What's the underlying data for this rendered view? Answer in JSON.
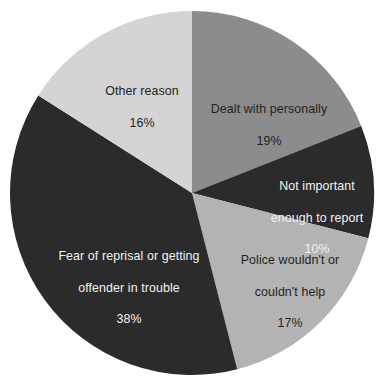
{
  "chart_data": {
    "type": "pie",
    "title": "",
    "subtitle": "",
    "xlabel": "",
    "ylabel": "",
    "legend_position": "none",
    "labels_inside_slices": true,
    "start_angle_deg": 0,
    "direction": "clockwise",
    "units": "percent",
    "categories": [
      "Dealt with personally",
      "Not important enough to report",
      "Police wouldn't or couldn't help",
      "Fear of reprisal or getting offender in trouble",
      "Other reason"
    ],
    "values": [
      19,
      10,
      17,
      38,
      16
    ],
    "slices": [
      {
        "id": "dealt-with-personally",
        "label": "Dealt with personally",
        "label_line1": "Dealt with personally",
        "label_line2": "",
        "value": 19,
        "value_text": "19%",
        "color": "#8c8c8c",
        "text_color": "#231f20",
        "start_deg": 0,
        "end_deg": 68.4
      },
      {
        "id": "not-important-enough-to-report",
        "label": "Not important enough to report",
        "label_line1": "Not important",
        "label_line2": "enough to report",
        "value": 10,
        "value_text": "10%",
        "color": "#2b2b2b",
        "text_color": "#f2f2f2",
        "start_deg": 68.4,
        "end_deg": 104.4
      },
      {
        "id": "police-wouldnt-or-couldnt-help",
        "label": "Police wouldn't or couldn't help",
        "label_line1": "Police wouldn't or",
        "label_line2": "couldn't help",
        "value": 17,
        "value_text": "17%",
        "color": "#b3b3b3",
        "text_color": "#231f20",
        "start_deg": 104.4,
        "end_deg": 165.6
      },
      {
        "id": "fear-of-reprisal-or-getting-offender-in-trouble",
        "label": "Fear of reprisal or getting offender in trouble",
        "label_line1": "Fear of reprisal or getting",
        "label_line2": "offender in trouble",
        "value": 38,
        "value_text": "38%",
        "color": "#2b2b2b",
        "text_color": "#f2f2f2",
        "start_deg": 165.6,
        "end_deg": 302.4
      },
      {
        "id": "other-reason",
        "label": "Other reason",
        "label_line1": "Other reason",
        "label_line2": "",
        "value": 16,
        "value_text": "16%",
        "color": "#d4d4d4",
        "text_color": "#231f20",
        "start_deg": 302.4,
        "end_deg": 360
      }
    ],
    "colors": [
      "#8c8c8c",
      "#2b2b2b",
      "#b3b3b3",
      "#2b2b2b",
      "#d4d4d4"
    ],
    "background": "#ffffff",
    "geometry": {
      "center_x": 192,
      "center_y": 193,
      "radius": 182
    }
  }
}
